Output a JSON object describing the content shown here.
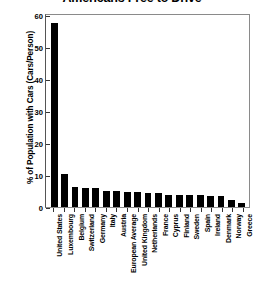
{
  "chart_data": {
    "type": "bar",
    "title": "Americans Free to Drive",
    "xlabel": "",
    "ylabel": "% of Population with Cars (Cars/Person)",
    "ylim": [
      0,
      60
    ],
    "yticks": [
      60,
      50,
      40,
      30,
      20,
      10,
      0
    ],
    "grid": false,
    "legend": null,
    "bar_color": "#000000",
    "background_color": "#ffffff",
    "categories": [
      "United States",
      "Luxembourg",
      "Belgium",
      "Switzerland",
      "Germany",
      "Italy",
      "Austria",
      "European Average",
      "United Kingdom",
      "Netherlands",
      "France",
      "Cyprus",
      "Finland",
      "Sweden",
      "Spain",
      "Ireland",
      "Denmark",
      "Norway",
      "Greece"
    ],
    "values": [
      57.5,
      10.2,
      6.2,
      6.0,
      5.9,
      5.1,
      5.0,
      4.8,
      4.6,
      4.5,
      4.4,
      3.9,
      3.8,
      3.7,
      3.6,
      3.5,
      3.3,
      2.1,
      1.2
    ]
  }
}
